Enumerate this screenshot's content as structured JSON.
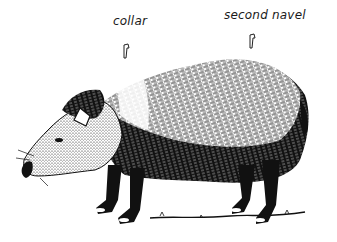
{
  "illustration": {
    "subject": "peccary",
    "style": "black-and-white pen-and-ink",
    "labels": [
      {
        "id": "collar",
        "text": "collar"
      },
      {
        "id": "second-navel",
        "text": "second navel"
      }
    ]
  }
}
